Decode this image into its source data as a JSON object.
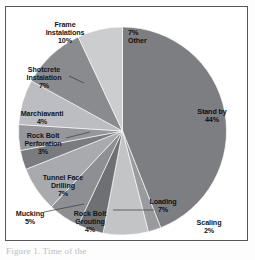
{
  "figure": {
    "caption": "Figure 1. Time of the",
    "frame_color": "#55565a",
    "background": "#ffffff"
  },
  "chart_data": {
    "type": "pie",
    "title": "",
    "subtitle": "",
    "xlabel": "",
    "ylabel": "",
    "legend_position": "none",
    "grid": false,
    "units": "percent",
    "start_angle_deg": 0,
    "direction": "clockwise",
    "categories": [
      "Stand by",
      "Scaling",
      "Loading",
      "Rock Bolt Grouting",
      "Mucking",
      "Tunnel Face Drilling",
      "Rock Bolt Perforation",
      "Marchiavanti",
      "Shotcrete Instalation",
      "Frame Instalations",
      "Other"
    ],
    "values": [
      44,
      2,
      7,
      4,
      5,
      7,
      3,
      4,
      7,
      10,
      7
    ],
    "value_labels": [
      "44%",
      "2%",
      "7%",
      "4%",
      "5%",
      "7%",
      "3%",
      "4%",
      "7%",
      "10%",
      "7%"
    ],
    "colors": [
      "#7d7e82",
      "#9a9b9e",
      "#c3c4c6",
      "#6f7074",
      "#8e8f93",
      "#a9aaad",
      "#7a7b7f",
      "#96979b",
      "#bcbdc0",
      "#8a8b8f",
      "#cccdcf"
    ],
    "slices": [
      {
        "name": "Stand by",
        "value": 44,
        "label": "Stand by\n44%",
        "label_placement": "inside"
      },
      {
        "name": "Scaling",
        "value": 2,
        "label": "Scaling\n2%",
        "label_placement": "outside"
      },
      {
        "name": "Loading",
        "value": 7,
        "label": "Loading\n7%",
        "label_placement": "inside"
      },
      {
        "name": "Rock Bolt Grouting",
        "value": 4,
        "label": "Rock Bolt\nGrouting\n4%",
        "label_placement": "outside"
      },
      {
        "name": "Mucking",
        "value": 5,
        "label": "Mucking\n5%",
        "label_placement": "outside"
      },
      {
        "name": "Tunnel Face Drilling",
        "value": 7,
        "label": "Tunnel Face\nDrilling\n7%",
        "label_placement": "outside"
      },
      {
        "name": "Rock Bolt Perforation",
        "value": 3,
        "label": "Rock Bolt\nPerforation\n3%",
        "label_placement": "outside"
      },
      {
        "name": "Marchiavanti",
        "value": 4,
        "label": "Marchiavanti\n4%",
        "label_placement": "outside"
      },
      {
        "name": "Shotcrete Instalation",
        "value": 7,
        "label": "Shotcrete\nInstalation\n7%",
        "label_placement": "outside"
      },
      {
        "name": "Frame Instalations",
        "value": 10,
        "label": "Frame\nInstalations\n10%",
        "label_placement": "outside"
      },
      {
        "name": "Other",
        "value": 7,
        "label": "7%\nOther",
        "label_placement": "inside"
      }
    ]
  },
  "labels": {
    "frame_installations": "Frame\nInstalations\n10%",
    "other": "7%\nOther",
    "shotcrete": "Shotcrete\nInstalation\n7%",
    "marchiavanti": "Marchiavanti\n4%",
    "rock_bolt_perforation": "Rock Bolt\nPerforation\n3%",
    "tunnel_face_drilling": "Tunnel Face\nDrilling\n7%",
    "mucking": "Mucking\n5%",
    "rock_bolt_grouting": "Rock Bolt\nGrouting\n4%",
    "loading": "Loading\n7%",
    "scaling": "Scaling\n2%",
    "standby": "Stand by\n44%"
  }
}
